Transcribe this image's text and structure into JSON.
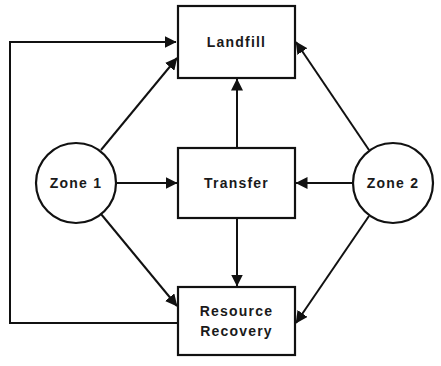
{
  "diagram": {
    "type": "flow",
    "colors": {
      "line": "#111111",
      "text": "#1a1a1a",
      "background": "#ffffff"
    },
    "nodes": [
      {
        "id": "landfill",
        "shape": "rectangle",
        "label_lines": [
          "Landfill"
        ]
      },
      {
        "id": "transfer",
        "shape": "rectangle",
        "label_lines": [
          "Transfer"
        ]
      },
      {
        "id": "recovery",
        "shape": "rectangle",
        "label_lines": [
          "Resource",
          "Recovery"
        ]
      },
      {
        "id": "zone1",
        "shape": "circle",
        "label_lines": [
          "Zone 1"
        ]
      },
      {
        "id": "zone2",
        "shape": "circle",
        "label_lines": [
          "Zone 2"
        ]
      }
    ],
    "edges": [
      {
        "from": "zone1",
        "to": "landfill"
      },
      {
        "from": "zone1",
        "to": "transfer"
      },
      {
        "from": "zone1",
        "to": "recovery"
      },
      {
        "from": "zone2",
        "to": "landfill"
      },
      {
        "from": "zone2",
        "to": "transfer"
      },
      {
        "from": "zone2",
        "to": "recovery"
      },
      {
        "from": "transfer",
        "to": "landfill"
      },
      {
        "from": "transfer",
        "to": "recovery"
      },
      {
        "from": "recovery",
        "to": "landfill",
        "routing": "loop-left"
      }
    ]
  }
}
